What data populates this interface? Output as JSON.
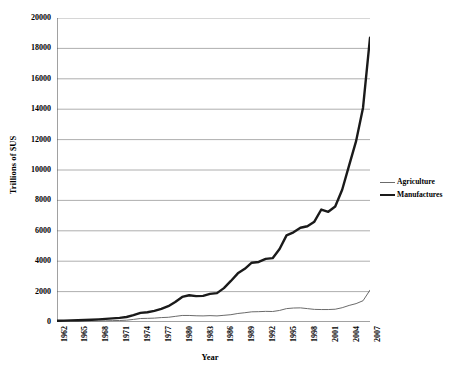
{
  "chart_data": {
    "type": "line",
    "title": "",
    "xlabel": "Year",
    "ylabel": "Trillions of $US",
    "xlim": [
      1962,
      2007
    ],
    "ylim": [
      0,
      20000
    ],
    "ytick_step": 2000,
    "grid": "horizontal",
    "legend_position": "right-middle",
    "y_ticks": [
      0,
      2000,
      4000,
      6000,
      8000,
      10000,
      12000,
      14000,
      16000,
      18000,
      20000
    ],
    "y_tick_labels": [
      "0",
      "2000",
      "4000",
      "6000",
      "8000",
      "10000",
      "12000",
      "14000",
      "16000",
      "18000",
      "20000"
    ],
    "x_ticks_all": [
      1962,
      1963,
      1964,
      1965,
      1966,
      1967,
      1968,
      1969,
      1970,
      1971,
      1972,
      1973,
      1974,
      1975,
      1976,
      1977,
      1978,
      1979,
      1980,
      1981,
      1982,
      1983,
      1984,
      1985,
      1986,
      1987,
      1988,
      1989,
      1990,
      1991,
      1992,
      1993,
      1994,
      1995,
      1996,
      1997,
      1998,
      1999,
      2000,
      2001,
      2002,
      2003,
      2004,
      2005,
      2006,
      2007
    ],
    "x_tick_labels": [
      "1962",
      "1965",
      "1968",
      "1971",
      "1974",
      "1977",
      "1980",
      "1983",
      "1986",
      "1989",
      "1992",
      "1995",
      "1998",
      "2001",
      "2004",
      "2007"
    ],
    "x_labeled_years": [
      1962,
      1965,
      1968,
      1971,
      1974,
      1977,
      1980,
      1983,
      1986,
      1989,
      1992,
      1995,
      1998,
      2001,
      2004,
      2007
    ],
    "x": [
      1962,
      1963,
      1964,
      1965,
      1966,
      1967,
      1968,
      1969,
      1970,
      1971,
      1972,
      1973,
      1974,
      1975,
      1976,
      1977,
      1978,
      1979,
      1980,
      1981,
      1982,
      1983,
      1984,
      1985,
      1986,
      1987,
      1988,
      1989,
      1990,
      1991,
      1992,
      1993,
      1994,
      1995,
      1996,
      1997,
      1998,
      1999,
      2000,
      2001,
      2002,
      2003,
      2004,
      2005,
      2006,
      2007
    ],
    "series": [
      {
        "name": "Agriculture",
        "color": "#6b6b6b",
        "line_width": 1,
        "values": [
          40,
          45,
          52,
          57,
          62,
          65,
          70,
          78,
          90,
          100,
          120,
          170,
          230,
          240,
          255,
          290,
          310,
          370,
          430,
          430,
          410,
          400,
          420,
          400,
          440,
          480,
          560,
          610,
          670,
          680,
          700,
          690,
          760,
          880,
          920,
          930,
          880,
          830,
          820,
          820,
          840,
          940,
          1090,
          1210,
          1400,
          2100
        ]
      },
      {
        "name": "Manufactures",
        "color": "#1a1a1a",
        "line_width": 2.4,
        "values": [
          80,
          90,
          105,
          120,
          135,
          150,
          175,
          205,
          240,
          270,
          330,
          450,
          600,
          640,
          730,
          860,
          1040,
          1320,
          1650,
          1760,
          1700,
          1720,
          1850,
          1900,
          2230,
          2700,
          3200,
          3500,
          3900,
          3950,
          4150,
          4200,
          4800,
          5700,
          5900,
          6200,
          6300,
          6600,
          7400,
          7250,
          7600,
          8700,
          10300,
          11900,
          14100,
          18700
        ]
      }
    ],
    "annotations": [
      "Manufactures exports grow from under 100 in 1962 to roughly 18700 by 2007",
      "Local peak near 7400 around 2000 followed by a dip near 7250 in 2001",
      "Plateau near 1700-1900 during 1981-1985",
      "Agriculture stays below 2200 throughout the period"
    ]
  },
  "legend": {
    "items": [
      {
        "label": "Agriculture",
        "icon": "thin-line-swatch"
      },
      {
        "label": "Manufactures",
        "icon": "thick-line-swatch"
      }
    ]
  },
  "axes": {
    "y_title": "Trillions of $US",
    "x_title": "Year"
  }
}
